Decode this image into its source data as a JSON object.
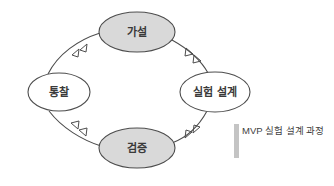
{
  "diagram": {
    "type": "cycle",
    "direction": "counterclockwise",
    "background_color": "#ffffff",
    "line_color": "#4d4d4d",
    "filled_node_color": "#d9d9d9",
    "plain_node_color": "#ffffff",
    "nodes": [
      {
        "id": "hypothesis",
        "label": "가설",
        "position": "top",
        "fill": "#d9d9d9",
        "cx": 137,
        "cy": 32,
        "rx": 38,
        "ry": 20
      },
      {
        "id": "experiment-design",
        "label": "실험 설계",
        "position": "right",
        "fill": "#ffffff",
        "cx": 215,
        "cy": 92,
        "rx": 35,
        "ry": 20
      },
      {
        "id": "verification",
        "label": "검증",
        "position": "bottom",
        "fill": "#d9d9d9",
        "cx": 137,
        "cy": 148,
        "rx": 38,
        "ry": 20
      },
      {
        "id": "insight",
        "label": "통찰",
        "position": "left",
        "fill": "#ffffff",
        "cx": 59,
        "cy": 92,
        "rx": 31,
        "ry": 19
      }
    ],
    "edges": [
      {
        "id": "edge-hypothesis-to-experiment",
        "from": "가설",
        "to": "실험 설계",
        "arrow": "double-chevron"
      },
      {
        "id": "edge-experiment-to-verification",
        "from": "실험 설계",
        "to": "검증",
        "arrow": "double-chevron"
      },
      {
        "id": "edge-verification-to-insight",
        "from": "검증",
        "to": "통찰",
        "arrow": "double-chevron"
      },
      {
        "id": "edge-insight-to-hypothesis",
        "from": "통찰",
        "to": "가설",
        "arrow": "double-chevron"
      }
    ]
  },
  "caption": {
    "text": "MVP 실험 설계 과정",
    "bar_color": "#c4c4c4"
  }
}
